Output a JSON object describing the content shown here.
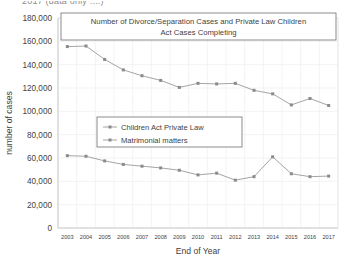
{
  "page": {
    "clipped_header_text": "2017 (data only ....)"
  },
  "chart_data": {
    "type": "line",
    "title": "Number of Divorce/Separation Cases and Private Law Children Act Cases Completing",
    "title_line1": "Number of Divorce/Separation Cases and Private Law Children",
    "title_line2": "Act Cases Completing",
    "xlabel": "End of Year",
    "ylabel": "number of cases",
    "categories": [
      "2003",
      "2004",
      "2005",
      "2006",
      "2007",
      "2008",
      "2009",
      "2010",
      "2011",
      "2012",
      "2013",
      "2014",
      "2015",
      "2016",
      "2017"
    ],
    "ylim": [
      0,
      180000
    ],
    "ytick_step": 20000,
    "yticks": [
      "0",
      "20,000",
      "40,000",
      "60,000",
      "80,000",
      "100,000",
      "120,000",
      "140,000",
      "160,000",
      "180,000"
    ],
    "grid": true,
    "legend_position": "center-left-inside",
    "series": [
      {
        "name": "Children Act Private Law",
        "color": "#9a9a9a",
        "values": [
          62000,
          61500,
          57500,
          54500,
          53000,
          51500,
          49500,
          45500,
          47000,
          41000,
          44000,
          61000,
          46500,
          44000,
          44500
        ]
      },
      {
        "name": "Matrimonial matters",
        "color": "#9a9a9a",
        "values": [
          155500,
          156000,
          144500,
          135500,
          130500,
          126500,
          120500,
          124000,
          123500,
          124000,
          118000,
          115000,
          105500,
          111000,
          105000
        ]
      }
    ]
  }
}
